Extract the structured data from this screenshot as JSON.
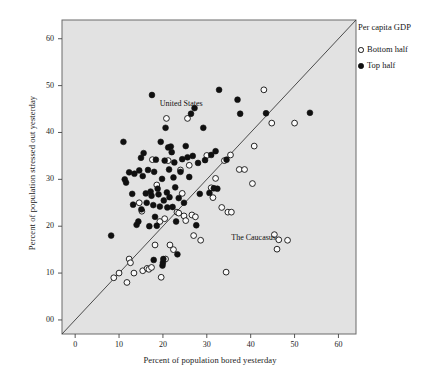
{
  "chart_data": {
    "type": "scatter",
    "title": "",
    "xlabel": "Percent of population bored yesterday",
    "ylabel": "Percent of population stressed out yesterday",
    "xlim": [
      -3,
      64
    ],
    "ylim": [
      -3,
      64
    ],
    "xticks": [
      0,
      10,
      20,
      30,
      40,
      50,
      60
    ],
    "xticklabels": [
      "0",
      "10",
      "20",
      "30",
      "40",
      "50",
      "60"
    ],
    "yticks": [
      0,
      10,
      20,
      30,
      40,
      50,
      60
    ],
    "yticklabels": [
      "00",
      "10",
      "20",
      "30",
      "40",
      "50",
      "60"
    ],
    "grid": false,
    "plot_background": "#e2e2e2",
    "reference_line": {
      "name": "45-degree line",
      "from": [
        -3,
        -3
      ],
      "to": [
        64,
        64
      ],
      "color": "#3a3a3a"
    },
    "legend": {
      "title": "Per capita GDP",
      "position": "right-top",
      "entries": [
        {
          "label": "Bottom half",
          "marker": "open-circle",
          "color": "#ffffff",
          "edge": "#111111"
        },
        {
          "label": "Top half",
          "marker": "filled-circle",
          "color": "#101010",
          "edge": "#101010"
        }
      ]
    },
    "annotations": [
      {
        "text": "United States",
        "x": 25.2,
        "y": 46.1
      },
      {
        "text": "The Caucasus",
        "x": 41.5,
        "y": 17.4
      }
    ],
    "series": [
      {
        "name": "Top half",
        "marker": "filled-circle",
        "color": "#101010",
        "points": [
          [
            8.2,
            18.0
          ],
          [
            11.0,
            38.0
          ],
          [
            11.3,
            30.0
          ],
          [
            11.6,
            29.3
          ],
          [
            12.3,
            31.5
          ],
          [
            13.0,
            26.9
          ],
          [
            13.2,
            24.6
          ],
          [
            13.5,
            31.2
          ],
          [
            14.0,
            20.3
          ],
          [
            14.4,
            21.0
          ],
          [
            14.6,
            31.9
          ],
          [
            15.0,
            34.6
          ],
          [
            15.1,
            23.6
          ],
          [
            15.4,
            30.7
          ],
          [
            15.6,
            35.6
          ],
          [
            16.1,
            27.0
          ],
          [
            16.3,
            25.0
          ],
          [
            16.6,
            32.0
          ],
          [
            16.9,
            20.0
          ],
          [
            17.2,
            27.4
          ],
          [
            17.4,
            26.5
          ],
          [
            17.5,
            48.0
          ],
          [
            17.8,
            24.5
          ],
          [
            17.9,
            12.8
          ],
          [
            18.0,
            31.6
          ],
          [
            18.2,
            22.0
          ],
          [
            18.4,
            34.2
          ],
          [
            18.6,
            20.1
          ],
          [
            18.8,
            28.0
          ],
          [
            19.0,
            26.8
          ],
          [
            19.3,
            24.2
          ],
          [
            19.5,
            38.0
          ],
          [
            19.8,
            30.1
          ],
          [
            19.9,
            11.6
          ],
          [
            20.0,
            12.2
          ],
          [
            20.1,
            13.0
          ],
          [
            20.2,
            25.5
          ],
          [
            20.4,
            34.0
          ],
          [
            20.6,
            41.0
          ],
          [
            20.9,
            27.2
          ],
          [
            21.0,
            24.0
          ],
          [
            21.2,
            36.8
          ],
          [
            21.4,
            32.1
          ],
          [
            21.5,
            26.2
          ],
          [
            21.8,
            37.0
          ],
          [
            22.0,
            35.8
          ],
          [
            22.2,
            24.1
          ],
          [
            22.4,
            30.4
          ],
          [
            22.6,
            33.6
          ],
          [
            22.8,
            28.3
          ],
          [
            23.0,
            21.0
          ],
          [
            23.3,
            14.0
          ],
          [
            23.6,
            26.0
          ],
          [
            24.0,
            31.6
          ],
          [
            24.4,
            34.3
          ],
          [
            24.8,
            25.0
          ],
          [
            25.2,
            37.1
          ],
          [
            25.6,
            34.7
          ],
          [
            26.0,
            30.5
          ],
          [
            26.4,
            44.0
          ],
          [
            26.8,
            35.0
          ],
          [
            27.2,
            45.2
          ],
          [
            27.6,
            20.2
          ],
          [
            28.0,
            33.5
          ],
          [
            28.4,
            26.9
          ],
          [
            29.2,
            41.0
          ],
          [
            29.6,
            34.1
          ],
          [
            30.6,
            27.1
          ],
          [
            31.0,
            35.2
          ],
          [
            31.6,
            28.1
          ],
          [
            32.0,
            36.0
          ],
          [
            32.4,
            28.0
          ],
          [
            32.8,
            49.1
          ],
          [
            34.5,
            34.2
          ],
          [
            37.0,
            47.0
          ],
          [
            37.6,
            44.0
          ],
          [
            43.5,
            44.1
          ],
          [
            53.5,
            44.2
          ]
        ]
      },
      {
        "name": "Bottom half",
        "marker": "open-circle",
        "color": "#ffffff",
        "points": [
          [
            8.8,
            9.0
          ],
          [
            10.0,
            10.0
          ],
          [
            11.8,
            8.0
          ],
          [
            12.3,
            13.0
          ],
          [
            12.6,
            12.2
          ],
          [
            13.4,
            10.0
          ],
          [
            14.6,
            25.0
          ],
          [
            15.2,
            23.2
          ],
          [
            15.4,
            10.5
          ],
          [
            16.4,
            11.0
          ],
          [
            16.8,
            10.8
          ],
          [
            17.4,
            11.2
          ],
          [
            17.6,
            34.2
          ],
          [
            18.2,
            16.0
          ],
          [
            18.6,
            28.8
          ],
          [
            19.3,
            21.0
          ],
          [
            19.6,
            9.1
          ],
          [
            20.4,
            21.6
          ],
          [
            20.6,
            13.0
          ],
          [
            20.8,
            43.0
          ],
          [
            21.2,
            34.0
          ],
          [
            21.6,
            16.0
          ],
          [
            22.4,
            15.0
          ],
          [
            23.2,
            23.0
          ],
          [
            23.6,
            22.8
          ],
          [
            24.0,
            32.0
          ],
          [
            24.4,
            27.0
          ],
          [
            24.8,
            22.2
          ],
          [
            25.2,
            21.2
          ],
          [
            25.6,
            43.0
          ],
          [
            26.0,
            33.0
          ],
          [
            26.6,
            22.4
          ],
          [
            27.0,
            18.0
          ],
          [
            27.4,
            22.0
          ],
          [
            28.6,
            17.0
          ],
          [
            30.0,
            35.1
          ],
          [
            31.0,
            28.2
          ],
          [
            31.4,
            26.1
          ],
          [
            32.0,
            30.2
          ],
          [
            33.4,
            24.0
          ],
          [
            34.0,
            34.0
          ],
          [
            34.4,
            10.2
          ],
          [
            34.8,
            23.0
          ],
          [
            35.4,
            35.2
          ],
          [
            35.6,
            23.0
          ],
          [
            37.4,
            32.1
          ],
          [
            38.6,
            32.1
          ],
          [
            40.4,
            29.1
          ],
          [
            40.8,
            37.1
          ],
          [
            43.0,
            49.1
          ],
          [
            44.8,
            42.0
          ],
          [
            45.4,
            18.2
          ],
          [
            46.0,
            15.1
          ],
          [
            46.4,
            17.1
          ],
          [
            48.4,
            17.0
          ],
          [
            50.0,
            42.0
          ]
        ]
      }
    ]
  },
  "axes": {
    "x_tick_labels": [
      "0",
      "10",
      "20",
      "30",
      "40",
      "50",
      "60"
    ],
    "y_tick_labels": [
      "00",
      "10",
      "20",
      "30",
      "40",
      "50",
      "60"
    ]
  }
}
